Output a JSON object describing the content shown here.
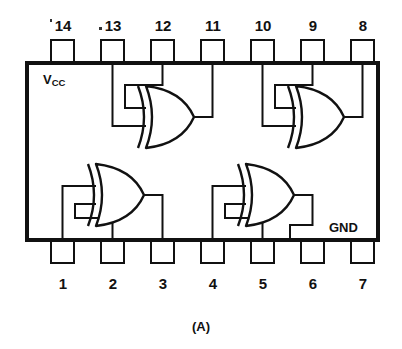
{
  "figure": {
    "caption": "(A)",
    "package": "14-pin DIP",
    "colors": {
      "ink": "#111111",
      "background": "#ffffff"
    }
  },
  "labels": {
    "vcc": "V",
    "vcc_sub": "CC",
    "gnd": "GND"
  },
  "pins": {
    "top_row": [
      {
        "number": "14",
        "function": "Vcc"
      },
      {
        "number": "13",
        "function": "gate1-input-a"
      },
      {
        "number": "12",
        "function": "gate1-input-b"
      },
      {
        "number": "11",
        "function": "gate1-output"
      },
      {
        "number": "10",
        "function": "gate2-input-a"
      },
      {
        "number": "9",
        "function": "gate2-input-b"
      },
      {
        "number": "8",
        "function": "gate2-output"
      }
    ],
    "bottom_row": [
      {
        "number": "1",
        "function": "gate3-input-a"
      },
      {
        "number": "2",
        "function": "gate3-input-b"
      },
      {
        "number": "3",
        "function": "gate3-output"
      },
      {
        "number": "4",
        "function": "gate4-input-a"
      },
      {
        "number": "5",
        "function": "gate4-input-b"
      },
      {
        "number": "6",
        "function": "gate4-output"
      },
      {
        "number": "7",
        "function": "GND"
      }
    ]
  },
  "gates": [
    {
      "id": "gate-top-left",
      "type": "XOR",
      "inputs": [
        "13",
        "12"
      ],
      "output": "11"
    },
    {
      "id": "gate-top-right",
      "type": "XOR",
      "inputs": [
        "10",
        "9"
      ],
      "output": "8"
    },
    {
      "id": "gate-bottom-left",
      "type": "XOR",
      "inputs": [
        "1",
        "2"
      ],
      "output": "3"
    },
    {
      "id": "gate-bottom-right",
      "type": "XOR",
      "inputs": [
        "4",
        "5"
      ],
      "output": "6"
    }
  ]
}
